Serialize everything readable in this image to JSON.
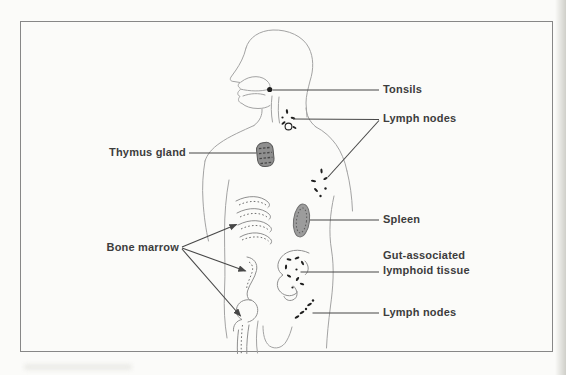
{
  "diagram": {
    "labels": {
      "tonsils": "Tonsils",
      "lymph_nodes_upper": "Lymph nodes",
      "thymus_gland": "Thymus gland",
      "spleen": "Spleen",
      "gut_associated_line1": "Gut-associated",
      "gut_associated_line2": "lymphoid tissue",
      "bone_marrow": "Bone marrow",
      "lymph_nodes_lower": "Lymph nodes"
    },
    "colors": {
      "bg": "#fbfbf9",
      "page_edge": "#cfcfc9",
      "border_c": "#878787",
      "line_art": "#a3a3a3",
      "line_art_2": "#8f8f8f",
      "stipple": "#707070",
      "organ_dark": "#1f1f1f",
      "organ_fill": "#9c9c9c",
      "leader": "#474747",
      "label_text": "#3d3d3d"
    }
  }
}
